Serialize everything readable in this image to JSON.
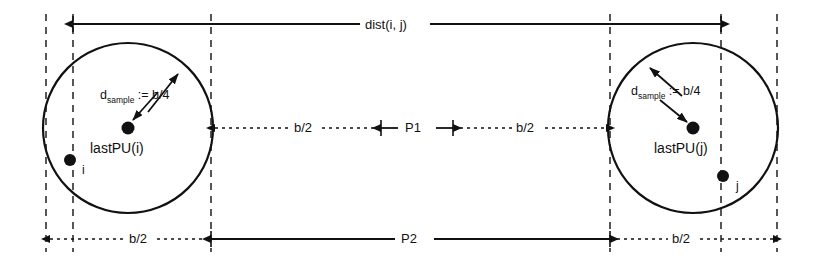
{
  "figure": {
    "type": "geometry-diagram",
    "background_color": "#ffffff",
    "stroke_color": "#111111",
    "width": 820,
    "height": 262
  },
  "labels": {
    "dist": "dist(i, j)",
    "b_half": "b/2",
    "p1": "P1",
    "p2": "P2",
    "d_sample_symbol": "d",
    "d_sample_subscript": "sample",
    "d_sample_value": ":= b/4",
    "lastpu_i": "lastPU(i)",
    "lastpu_j": "lastPU(j)",
    "node_i": "i",
    "node_j": "j"
  },
  "dimension_rows": {
    "top": {
      "label": "dist(i, j)",
      "style": "solid",
      "arrows": "both"
    },
    "middle": [
      {
        "label": "b/2",
        "style": "dotted"
      },
      {
        "label": "P1",
        "style": "solid"
      },
      {
        "label": "b/2",
        "style": "dotted"
      }
    ],
    "bottom": [
      {
        "label": "b/2",
        "style": "dotted"
      },
      {
        "label": "P2",
        "style": "solid"
      },
      {
        "label": "b/2",
        "style": "dotted"
      }
    ]
  },
  "circles": [
    {
      "name": "cell-i",
      "cx": 128,
      "cy": 128,
      "r": 85,
      "center_label": "lastPU(i)",
      "node_label": "i"
    },
    {
      "name": "cell-j",
      "cx": 693,
      "cy": 128,
      "r": 85,
      "center_label": "lastPU(j)",
      "node_label": "j"
    }
  ],
  "guide_lines_x": [
    46,
    73,
    211,
    610,
    721,
    777
  ]
}
